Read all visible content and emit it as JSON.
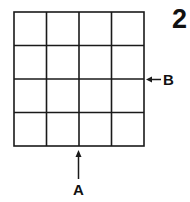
{
  "figure": {
    "number": "2",
    "grid": {
      "rows": 4,
      "cols": 4
    },
    "labels": {
      "a": "A",
      "b": "B"
    },
    "colors": {
      "line": "#1a1a1a",
      "background": "#ffffff"
    }
  }
}
